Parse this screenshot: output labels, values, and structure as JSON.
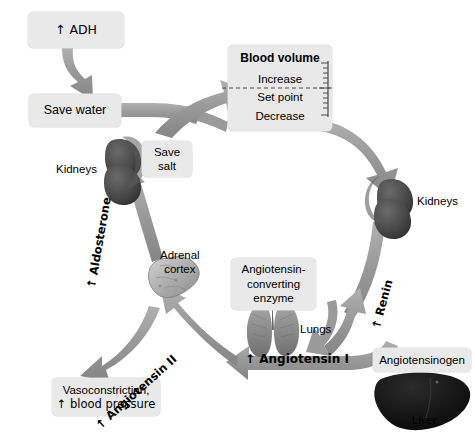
{
  "diagram": {
    "colors": {
      "arrow_gray": "#9a9a9a",
      "arrow_gray_dark": "#8a8a8a",
      "box_fill": "#e9e9e9",
      "kidney": "#4a4a4a",
      "liver": "#1a1a1a",
      "adrenal": "#b6b6b6",
      "lung": "#8f8f8f",
      "text": "#000000"
    }
  },
  "boxes": {
    "adh": "↑ ADH",
    "save_water": "Save water",
    "blood_volume": {
      "title": "Blood volume",
      "increase": "Increase",
      "set_point": "Set point",
      "decrease": "Decrease"
    },
    "save_salt": "Save\nsalt",
    "save_salt_line1": "Save",
    "save_salt_line2": "salt",
    "ace_line1": "Angiotensin-",
    "ace_line2": "converting",
    "ace_line3": "enzyme",
    "angiotensinogen": "Angiotensinogen",
    "vasoconstriction_line1": "Vasoconstriction,",
    "vasoconstriction_line2": "↑ blood pressure"
  },
  "labels": {
    "kidneys_left": "Kidneys",
    "kidneys_right": "Kidneys",
    "lungs": "Lungs",
    "liver": "Liver",
    "adrenal_line1": "Adrenal",
    "adrenal_line2": "cortex"
  },
  "arrow_labels": {
    "aldosterone": "↑ Aldosterone",
    "renin": "↑ Renin",
    "angiotensin_ii": "↑ Angiotensin II",
    "angiotensin_i": "↑ Angiotensin I"
  },
  "icons": {
    "kidney_left": "kidney-icon",
    "kidney_right": "kidney-icon",
    "liver": "liver-icon",
    "lungs": "lungs-icon",
    "adrenal_cortex": "adrenal-cortex-icon",
    "up_arrow": "up-arrow-icon",
    "scale_ticks": "ruler-scale-icon"
  }
}
